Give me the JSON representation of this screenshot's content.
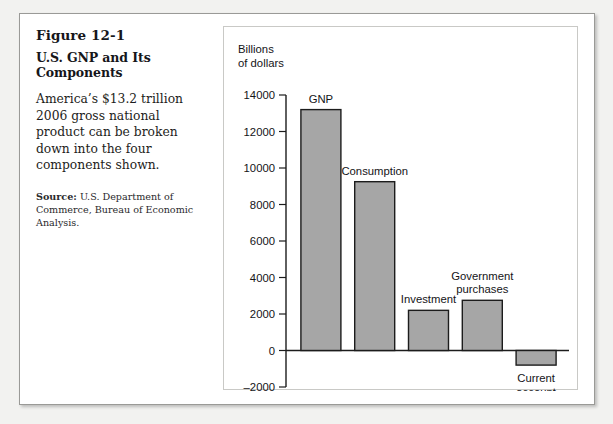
{
  "figure": {
    "number": "Figure 12-1",
    "title": "U.S. GNP and Its Components",
    "description": "America’s $13.2 trillion 2006 gross national product can be broken down into the four components shown.",
    "source_lead": "Source:",
    "source_text": " U.S. Department of Commerce, Bureau of Economic Analysis."
  },
  "chart_data": {
    "type": "bar",
    "title": "U.S. GNP and Its Components",
    "xlabel": "",
    "ylabel": "Billions of dollars",
    "ylabel_line1": "Billions",
    "ylabel_line2": "of dollars",
    "categories": [
      "GNP",
      "Consumption",
      "Investment",
      "Government purchases",
      "Current account"
    ],
    "values": [
      13200,
      9250,
      2200,
      2750,
      -800
    ],
    "ylim": [
      -2000,
      14000
    ],
    "yticks": [
      14000,
      12000,
      10000,
      8000,
      6000,
      4000,
      2000,
      0,
      -2000
    ],
    "ytick_labels": [
      "14000",
      "12000",
      "10000",
      "8000",
      "6000",
      "4000",
      "2000",
      "0",
      "–2000"
    ],
    "grid": false,
    "legend": false,
    "bar_color": "#a6a6a6",
    "bar_edge_color": "#1c1c1c",
    "label_positions": [
      "above",
      "above",
      "above",
      "above",
      "below"
    ],
    "bar_labels": [
      {
        "name": "GNP",
        "lines": [
          "GNP"
        ]
      },
      {
        "name": "Consumption",
        "lines": [
          "Consumption"
        ]
      },
      {
        "name": "Investment",
        "lines": [
          "Investment"
        ]
      },
      {
        "name": "Government purchases",
        "lines": [
          "Government",
          "purchases"
        ]
      },
      {
        "name": "Current account",
        "lines": [
          "Current",
          "account"
        ]
      }
    ]
  }
}
